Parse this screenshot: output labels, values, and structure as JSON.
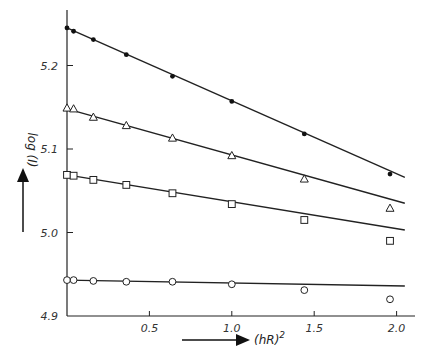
{
  "chart_data": {
    "type": "scatter",
    "title": "",
    "xlabel": "(hR)^2",
    "ylabel": "log (I)",
    "xlim": [
      0,
      2.1
    ],
    "ylim": [
      4.9,
      5.26
    ],
    "x_ticks": [
      "0.5",
      "1.0",
      "1.5",
      "2.0"
    ],
    "y_ticks": [
      "4.9",
      "5.0",
      "5.1",
      "5.2"
    ],
    "grid": false,
    "legend": null,
    "x": [
      0.0,
      0.04,
      0.16,
      0.36,
      0.64,
      1.0,
      1.44,
      1.96
    ],
    "series": [
      {
        "name": "filled-circles",
        "marker": "filled-circle",
        "values": [
          5.245,
          5.241,
          5.231,
          5.213,
          5.187,
          5.157,
          5.118,
          5.07
        ],
        "fit_line": {
          "x0": 0.0,
          "y0": 5.245,
          "x1": 2.05,
          "y1": 5.066
        }
      },
      {
        "name": "triangles",
        "marker": "open-triangle",
        "values": [
          5.149,
          5.148,
          5.138,
          5.128,
          5.113,
          5.092,
          5.064,
          5.029
        ],
        "fit_line": {
          "x0": 0.0,
          "y0": 5.148,
          "x1": 2.05,
          "y1": 5.035
        }
      },
      {
        "name": "squares",
        "marker": "open-square",
        "values": [
          5.069,
          5.068,
          5.063,
          5.057,
          5.047,
          5.034,
          5.015,
          4.99
        ],
        "fit_line": {
          "x0": 0.0,
          "y0": 5.069,
          "x1": 2.05,
          "y1": 5.003
        }
      },
      {
        "name": "circles",
        "marker": "open-circle",
        "values": [
          4.943,
          4.943,
          4.942,
          4.941,
          4.941,
          4.938,
          4.931,
          4.92
        ],
        "fit_line": {
          "x0": 0.0,
          "y0": 4.943,
          "x1": 2.05,
          "y1": 4.936
        }
      }
    ],
    "annotations": [
      "arrow pointing up beside y-axis label",
      "arrow pointing right before x-axis label"
    ]
  },
  "labels": {
    "xlabel_main": "(hR)",
    "xlabel_sup": "2",
    "ylabel": "log (I)"
  }
}
